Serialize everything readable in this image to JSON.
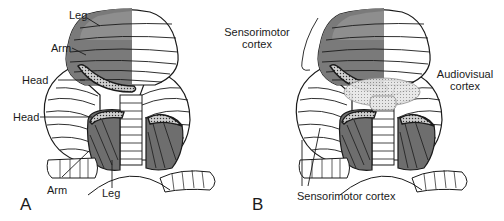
{
  "panel_a": {
    "letter": "A",
    "labels": {
      "leg_top": "Leg",
      "arm_top": "Arm",
      "head_upper": "Head",
      "head_lower": "Head",
      "arm_bottom": "Arm",
      "leg_bottom": "Leg"
    }
  },
  "panel_b": {
    "letter": "B",
    "labels": {
      "sensorimotor_top_line1": "Sensorimotor",
      "sensorimotor_top_line2": "cortex",
      "audiovisual_line1": "Audiovisual",
      "audiovisual_line2": "cortex",
      "sensorimotor_bottom": "Sensorimotor cortex"
    }
  },
  "colors": {
    "dark_region": "#6e6e6e",
    "mid_region": "#8a8a8a",
    "light_region": "#d9d9d9",
    "outline": "#1a1a1a"
  }
}
